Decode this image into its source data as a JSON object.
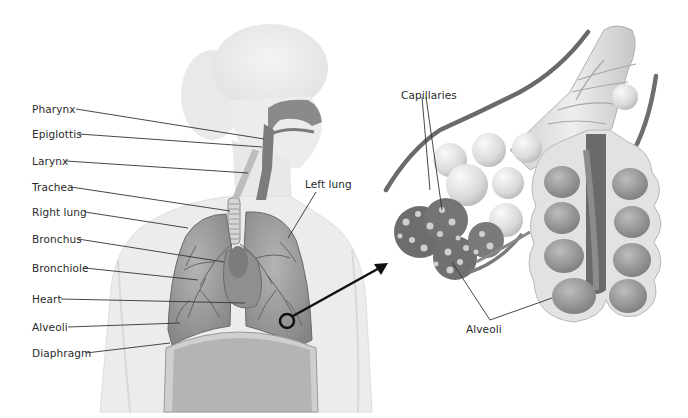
{
  "figure": {
    "left_panel": {
      "labels": [
        {
          "text": "Pharynx",
          "x": 32,
          "y": 103
        },
        {
          "text": "Epiglottis",
          "x": 32,
          "y": 128
        },
        {
          "text": "Larynx",
          "x": 32,
          "y": 155
        },
        {
          "text": "Trachea",
          "x": 32,
          "y": 181
        },
        {
          "text": "Right lung",
          "x": 32,
          "y": 206
        },
        {
          "text": "Bronchus",
          "x": 32,
          "y": 233
        },
        {
          "text": "Bronchiole",
          "x": 32,
          "y": 262
        },
        {
          "text": "Heart",
          "x": 32,
          "y": 293
        },
        {
          "text": "Alveoli",
          "x": 32,
          "y": 321
        },
        {
          "text": "Diaphragm",
          "x": 32,
          "y": 347
        }
      ],
      "left_lung_label": {
        "text": "Left lung",
        "x": 305,
        "y": 178
      }
    },
    "right_panel": {
      "capillaries_label": {
        "text": "Capillaries",
        "x": 401,
        "y": 89
      },
      "alveoli_label": {
        "text": "Alveoli",
        "x": 466,
        "y": 323
      }
    },
    "colors": {
      "background": "#ffffff",
      "body_fill": "#ececec",
      "body_stroke": "#d4d4d4",
      "lung_fill": "#9a9a9a",
      "lung_dark": "#6f6f6f",
      "airway": "#7a7a7a",
      "leader_line": "#333333",
      "arrow": "#111111",
      "alveoli_sac": "#dcdcdc",
      "capillary": "#5a5a5a"
    }
  }
}
